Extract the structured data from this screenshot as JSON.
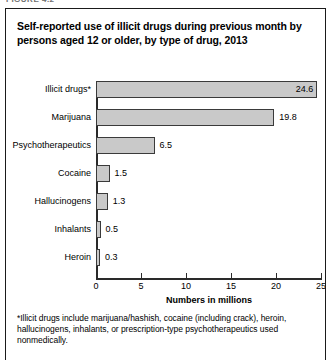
{
  "figure_caption": "FIGURE 4.2",
  "figure": {
    "title": "Self-reported use of illicit drugs during previous month by persons aged 12 or older, by type of drug, 2013",
    "footnote_marker": "*",
    "footnote": "Illicit drugs include marijuana/hashish, cocaine (including crack), heroin, hallucinogens, inhalants, or prescription-type psychotherapeutics used nonmedically."
  },
  "chart_data": {
    "type": "bar",
    "orientation": "horizontal",
    "title": "Self-reported use of illicit drugs during previous month by persons aged 12 or older, by type of drug, 2013",
    "categories": [
      "Illicit drugs*",
      "Marijuana",
      "Psychotherapeutics",
      "Cocaine",
      "Hallucinogens",
      "Inhalants",
      "Heroin"
    ],
    "values": [
      24.6,
      19.8,
      6.5,
      1.5,
      1.3,
      0.5,
      0.3
    ],
    "value_labels": [
      "24.6",
      "19.8",
      "6.5",
      "1.5",
      "1.3",
      "0.5",
      "0.3"
    ],
    "label_placement": [
      "inside",
      "outside",
      "outside",
      "outside",
      "outside",
      "outside",
      "outside"
    ],
    "xlabel": "Numbers in millions",
    "ylabel": "",
    "xlim": [
      0,
      25
    ],
    "xticks": [
      0,
      5,
      10,
      15,
      20,
      25
    ],
    "xtick_labels": [
      "0",
      "5",
      "10",
      "15",
      "20",
      "25"
    ],
    "grid": false,
    "legend": false,
    "bar_color": "#c9c9c9",
    "bar_edge_color": "#3a3a3a",
    "axis_color": "#2a2a2a"
  }
}
